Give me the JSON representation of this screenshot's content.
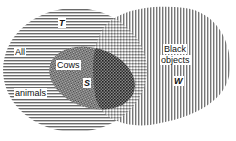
{
  "diagram": {
    "type": "venn",
    "sets": [
      {
        "id": "animals",
        "label_line1": "All",
        "label_line2": "animals",
        "symbol": "T",
        "fill": "horizontal-lines"
      },
      {
        "id": "cows",
        "label": "Cows",
        "symbol": "S",
        "fill": "crosshatch"
      },
      {
        "id": "black",
        "label_line1": "Black",
        "label_line2": "objects",
        "symbol": "W",
        "fill": "vertical-lines"
      }
    ],
    "colors": {
      "line": "#555555",
      "dark": "#333333",
      "background": "#ffffff"
    }
  }
}
